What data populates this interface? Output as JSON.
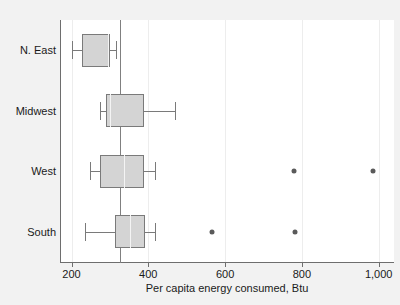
{
  "chart_data": {
    "type": "box",
    "title": "",
    "xlabel": "Per capita energy consumed, Btu",
    "ylabel": "",
    "orientation": "horizontal",
    "xlim": [
      170,
      1040
    ],
    "xticks": [
      200,
      400,
      600,
      800,
      1000
    ],
    "xticklabels": [
      "200",
      "400",
      "600",
      "800",
      "1,000"
    ],
    "grid": true,
    "grid_axis": "x",
    "legend": null,
    "reference_line": 325,
    "categories": [
      "N. East",
      "Midwest",
      "West",
      "South"
    ],
    "boxes": [
      {
        "category": "N. East",
        "whisker_low": 200,
        "q1": 228,
        "median": 296,
        "q3": 299,
        "whisker_high": 317,
        "outliers": []
      },
      {
        "category": "Midwest",
        "whisker_low": 273,
        "q1": 291,
        "median": 301,
        "q3": 390,
        "whisker_high": 470,
        "outliers": []
      },
      {
        "category": "West",
        "whisker_low": 247,
        "q1": 273,
        "median": 338,
        "q3": 390,
        "whisker_high": 418,
        "outliers": [
          779,
          985
        ]
      },
      {
        "category": "South",
        "whisker_low": 236,
        "q1": 314,
        "median": 353,
        "q3": 392,
        "whisker_high": 418,
        "outliers": [
          566,
          782
        ]
      }
    ],
    "colors": {
      "box_fill": "#d4d4d4",
      "box_edge": "#7a7a7a",
      "median": "#f4f4f4",
      "outlier": "#5a5a5a",
      "axis": "#6e6e6e",
      "grid": "#ededed",
      "reference_line": "#808080",
      "plot_background": "#ffffff",
      "page_background": "#f2f2f2",
      "text": "#1a1a1a"
    }
  }
}
